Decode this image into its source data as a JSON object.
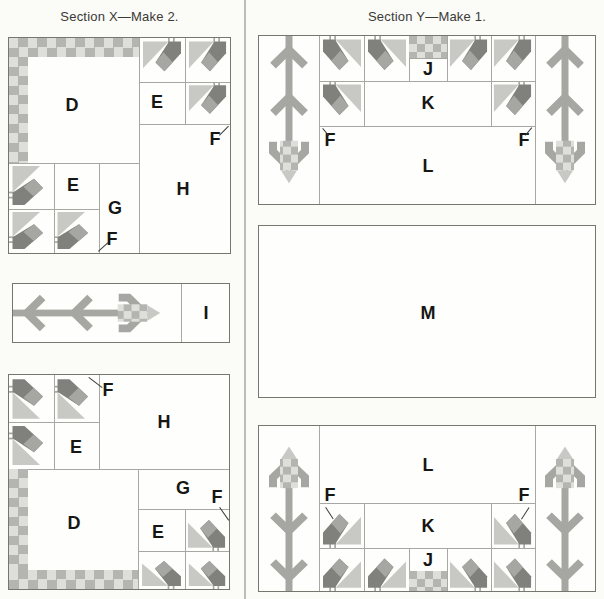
{
  "sections": {
    "x": {
      "title": "Section X—Make 2.",
      "top_unit": {
        "d": "D",
        "e_right": "E",
        "f_right": "F",
        "h": "H",
        "e_left": "E",
        "g": "G",
        "f_left": "F"
      },
      "strip_unit": {
        "i": "I"
      },
      "bottom_unit": {
        "f_top": "F",
        "h": "H",
        "e_left": "E",
        "d": "D",
        "g": "G",
        "e_right": "E",
        "f_right": "F"
      }
    },
    "y": {
      "title": "Section Y—Make 1.",
      "top_unit": {
        "j": "J",
        "k": "K",
        "l": "L",
        "f_left": "F",
        "f_right": "F"
      },
      "middle_unit": {
        "m": "M"
      },
      "bottom_unit": {
        "l": "L",
        "k": "K",
        "j": "J",
        "f_left": "F",
        "f_right": "F"
      }
    }
  },
  "colors": {
    "gray_light": "#c8c8c4",
    "gray_mid": "#a6a6a2",
    "gray_dark": "#80807c",
    "checker_light": "#dededa",
    "checker_mid": "#b4b4b0",
    "line": "#a8a8a2",
    "outline": "#76766f",
    "text": "#161614",
    "heading": "#3a3a36",
    "background": "#fbfbf8",
    "block_background": "#fefefc"
  }
}
